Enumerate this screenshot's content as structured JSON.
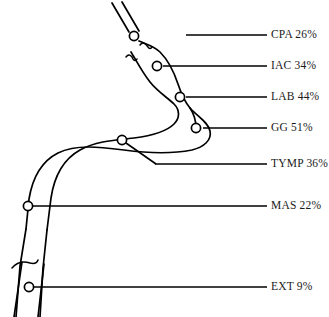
{
  "diagram": {
    "background_color": "#ffffff",
    "line_color": "#000000",
    "text_color": "#1a1a1a",
    "marker_fill": "#ffffff",
    "labels": [
      {
        "id": "cpa",
        "name": "CPA",
        "value": "26%",
        "text": "CPA 26%",
        "text_x": 271,
        "text_y": 35,
        "line_y": 35,
        "line_x1": 186,
        "line_x2": 267
      },
      {
        "id": "iac",
        "name": "IAC",
        "value": "34%",
        "text": "IAC 34%",
        "text_x": 271,
        "text_y": 66,
        "line_y": 66,
        "line_x1": 163,
        "line_x2": 267
      },
      {
        "id": "lab",
        "name": "LAB",
        "value": "44%",
        "text": "LAB 44%",
        "text_x": 271,
        "text_y": 97,
        "line_y": 97,
        "line_x1": 186,
        "line_x2": 267
      },
      {
        "id": "gg",
        "name": "GG",
        "value": "51%",
        "text": "GG 51%",
        "text_x": 271,
        "text_y": 128,
        "line_y": 128,
        "line_x1": 203,
        "line_x2": 267
      },
      {
        "id": "tymp",
        "name": "TYMP",
        "value": "36%",
        "text": "TYMP 36%",
        "text_x": 271,
        "text_y": 164,
        "line_y": 164,
        "line_x1": 155,
        "line_x2": 267
      },
      {
        "id": "mas",
        "name": "MAS",
        "value": "22%",
        "text": "MAS 22%",
        "text_x": 271,
        "text_y": 206,
        "line_y": 206,
        "line_x1": 31,
        "line_x2": 267
      },
      {
        "id": "ext",
        "name": "EXT",
        "value": "9%",
        "text": "EXT 9%",
        "text_x": 271,
        "text_y": 287,
        "line_y": 287,
        "line_x1": 33,
        "line_x2": 267
      }
    ],
    "markers": [
      {
        "id": "cpa-marker",
        "cx": 134,
        "cy": 36,
        "r": 4.6
      },
      {
        "id": "iac-marker",
        "cx": 157,
        "cy": 66,
        "r": 4.6
      },
      {
        "id": "lab-marker",
        "cx": 180,
        "cy": 97,
        "r": 4.6
      },
      {
        "id": "gg-marker",
        "cx": 196,
        "cy": 128,
        "r": 4.6
      },
      {
        "id": "tymp-marker",
        "cx": 122,
        "cy": 140,
        "r": 4.6
      },
      {
        "id": "mas-marker",
        "cx": 28,
        "cy": 206,
        "r": 4.6
      },
      {
        "id": "ext-marker",
        "cx": 29,
        "cy": 287,
        "r": 4.6
      }
    ]
  }
}
